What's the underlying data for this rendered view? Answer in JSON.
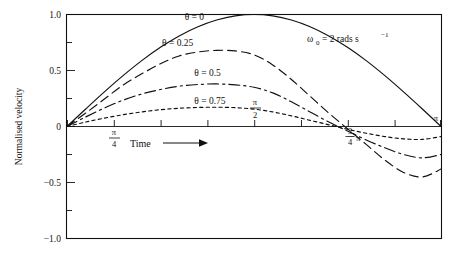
{
  "figure": {
    "annotation": "ω₀ = 2 rads s⁻¹",
    "annotation_omega": "ω",
    "annotation_sub": "0",
    "annotation_rest": "= 2 rads s",
    "annotation_sup": "−1",
    "time_label": "Time",
    "time_arrow_icon": "right-arrow-icon",
    "ylabel": "Normalised velocity"
  },
  "chart_data": {
    "type": "line",
    "title": "",
    "xlabel": "Time",
    "ylabel": "Normalised velocity",
    "annotation": "ω₀ = 2 rads s⁻¹",
    "xlim": [
      0,
      3.14159
    ],
    "ylim": [
      -1.0,
      1.0
    ],
    "grid": false,
    "legend_position": "inline-curve-labels",
    "x_tick_labels": [
      "",
      "π/4",
      "π/2",
      "3π/4",
      "π"
    ],
    "x_tick_values": [
      0,
      0.7854,
      1.5708,
      2.3562,
      3.14159
    ],
    "x_minor_tick_count": 8,
    "y_tick_labels": [
      "1.0",
      "0.5",
      "0",
      "−0.5",
      "−1.0"
    ],
    "y_tick_values": [
      1.0,
      0.5,
      0,
      -0.5,
      -1.0
    ],
    "y_minor_tick_values": [
      0.75,
      0.25,
      -0.25,
      -0.75
    ],
    "series": [
      {
        "name": "θ = 0",
        "label": "θ = 0",
        "linestyle": "solid",
        "damping": 0.0,
        "peak": 1.0,
        "trough": -1.0,
        "label_x": 1.07,
        "label_y": 0.95,
        "x": [
          0.0,
          0.157,
          0.314,
          0.471,
          0.628,
          0.785,
          0.942,
          1.1,
          1.257,
          1.414,
          1.571,
          1.728,
          1.885,
          2.042,
          2.199,
          2.356,
          2.513,
          2.67,
          2.827,
          2.985,
          3.142
        ],
        "y": [
          0.0,
          0.156,
          0.309,
          0.454,
          0.588,
          0.707,
          0.809,
          0.891,
          0.951,
          0.988,
          1.0,
          0.988,
          0.951,
          0.891,
          0.809,
          0.707,
          0.588,
          0.454,
          0.309,
          0.156,
          0.0
        ]
      },
      {
        "name": "θ = 0.25",
        "label": "θ = 0.25",
        "linestyle": "dashed",
        "damping": 0.25,
        "peak": 0.68,
        "trough": -0.72,
        "label_x": 0.93,
        "label_y": 0.72,
        "x": [
          0.0,
          0.157,
          0.314,
          0.471,
          0.628,
          0.785,
          0.942,
          1.1,
          1.257,
          1.414,
          1.571,
          1.728,
          1.885,
          2.042,
          2.199,
          2.356,
          2.513,
          2.67,
          2.827,
          2.985,
          3.142
        ],
        "y": [
          0.0,
          0.12,
          0.245,
          0.37,
          0.47,
          0.56,
          0.63,
          0.665,
          0.68,
          0.675,
          0.64,
          0.55,
          0.42,
          0.27,
          0.12,
          -0.02,
          -0.16,
          -0.3,
          -0.41,
          -0.45,
          -0.38
        ]
      },
      {
        "name": "θ = 0.5",
        "label": "θ = 0.5",
        "linestyle": "dashdot",
        "damping": 0.5,
        "peak": 0.38,
        "trough": -0.45,
        "label_x": 1.18,
        "label_y": 0.45,
        "x": [
          0.0,
          0.157,
          0.314,
          0.471,
          0.628,
          0.785,
          0.942,
          1.1,
          1.257,
          1.414,
          1.571,
          1.728,
          1.885,
          2.042,
          2.199,
          2.356,
          2.513,
          2.67,
          2.827,
          2.985,
          3.142
        ],
        "y": [
          0.0,
          0.085,
          0.165,
          0.235,
          0.29,
          0.33,
          0.36,
          0.375,
          0.38,
          0.372,
          0.35,
          0.3,
          0.22,
          0.13,
          0.04,
          -0.04,
          -0.12,
          -0.19,
          -0.25,
          -0.28,
          -0.25
        ]
      },
      {
        "name": "θ = 0.75",
        "label": "θ = 0.75",
        "linestyle": "dotted",
        "damping": 0.75,
        "peak": 0.17,
        "trough": -0.18,
        "label_x": 1.2,
        "label_y": 0.2,
        "x": [
          0.0,
          0.157,
          0.314,
          0.471,
          0.628,
          0.785,
          0.942,
          1.1,
          1.257,
          1.414,
          1.571,
          1.728,
          1.885,
          2.042,
          2.199,
          2.356,
          2.513,
          2.67,
          2.827,
          2.985,
          3.142
        ],
        "y": [
          0.0,
          0.04,
          0.075,
          0.105,
          0.13,
          0.15,
          0.163,
          0.17,
          0.172,
          0.168,
          0.155,
          0.13,
          0.095,
          0.055,
          0.015,
          -0.025,
          -0.06,
          -0.09,
          -0.11,
          -0.115,
          -0.09
        ]
      }
    ]
  }
}
